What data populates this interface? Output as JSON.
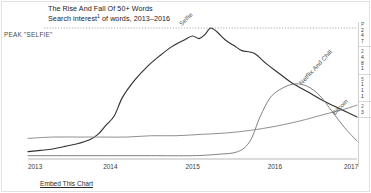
{
  "header": {
    "title": "The Rise And Fall Of 50+ Words",
    "subtitle_prefix": "Search interest",
    "subtitle_footnote": "1",
    "subtitle_suffix": " of words, 2013–2016"
  },
  "annotations": {
    "peak_label": "PEAK \"SELFIE\""
  },
  "footer": {
    "embed_link": "Embed This Chart"
  },
  "side_panel": {
    "groups": [
      {
        "head": "P",
        "rows": [
          "2",
          "4",
          "7"
        ]
      },
      {
        "head": "2",
        "rows": [
          "4",
          "8",
          "1"
        ]
      },
      {
        "head": "5",
        "rows": [
          "1",
          "1",
          "1"
        ]
      },
      {
        "head": "2",
        "rows": [
          "3"
        ]
      }
    ]
  },
  "chart_data": {
    "type": "line",
    "title": "The Rise And Fall Of 50+ Words",
    "subtitle": "Search interest of words, 2013–2016",
    "xlabel": "",
    "ylabel": "",
    "grid": false,
    "legend_position": "inline-end-of-line",
    "xlim": [
      2013,
      2017
    ],
    "ylim": [
      0,
      100
    ],
    "x_ticks": [
      "2013",
      "2014",
      "2015",
      "2016",
      "2017"
    ],
    "annotations": [
      {
        "text": "PEAK \"SELFIE\"",
        "type": "horizontal-reference-line",
        "y": 97,
        "style": "dotted"
      }
    ],
    "series": [
      {
        "name": "Selfie",
        "color": "#333333",
        "label_position": "peak",
        "x": [
          2013.0,
          2013.15,
          2013.3,
          2013.45,
          2013.6,
          2013.75,
          2013.85,
          2013.95,
          2014.05,
          2014.15,
          2014.3,
          2014.45,
          2014.6,
          2014.75,
          2014.9,
          2015.0,
          2015.08,
          2015.15,
          2015.22,
          2015.3,
          2015.4,
          2015.5,
          2015.6,
          2015.75,
          2015.9,
          2016.05,
          2016.2,
          2016.4,
          2016.6,
          2016.8,
          2017.0
        ],
        "y": [
          4,
          5,
          6,
          8,
          10,
          13,
          17,
          24,
          31,
          45,
          58,
          68,
          76,
          83,
          88,
          91,
          89,
          92,
          97,
          94,
          88,
          84,
          80,
          78,
          70,
          63,
          56,
          49,
          42,
          36,
          30
        ]
      },
      {
        "name": "Netflix And Chill",
        "color": "#7a7a7a",
        "label_position": "peak",
        "x": [
          2013.0,
          2013.5,
          2014.0,
          2014.5,
          2015.0,
          2015.3,
          2015.55,
          2015.7,
          2015.82,
          2015.95,
          2016.1,
          2016.25,
          2016.4,
          2016.55,
          2016.7,
          2016.85,
          2017.0
        ],
        "y": [
          1,
          1,
          1,
          1,
          1,
          2,
          4,
          12,
          30,
          45,
          52,
          55,
          53,
          46,
          34,
          22,
          12
        ]
      },
      {
        "name": "Bitcoin",
        "color": "#8a8a8a",
        "label_position": "end",
        "x": [
          2013.0,
          2013.3,
          2013.6,
          2013.9,
          2014.2,
          2014.5,
          2014.8,
          2015.1,
          2015.4,
          2015.7,
          2016.0,
          2016.3,
          2016.6,
          2016.85,
          2017.0
        ],
        "y": [
          14,
          15,
          15,
          15,
          15,
          16,
          16,
          17,
          18,
          20,
          23,
          27,
          32,
          36,
          39
        ]
      }
    ]
  }
}
